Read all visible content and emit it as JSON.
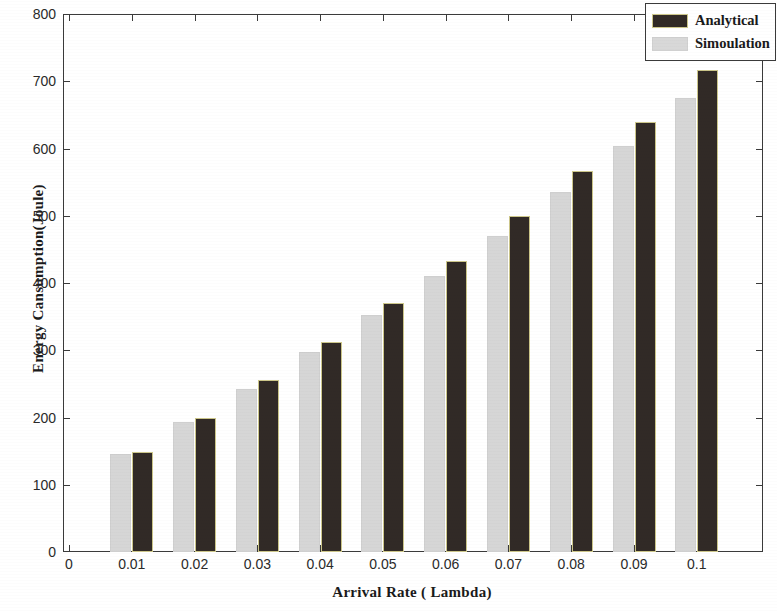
{
  "chart_data": {
    "type": "bar",
    "title": "Energy Cansumption In All Sensor Nodes",
    "xlabel": "Arrival Rate ( Lambda)",
    "ylabel": "Energy Cansumption(Joule)",
    "categories": [
      "0.01",
      "0.02",
      "0.03",
      "0.04",
      "0.05",
      "0.06",
      "0.07",
      "0.08",
      "0.09",
      "0.1"
    ],
    "xtick_labels": [
      "0",
      "0.01",
      "0.02",
      "0.03",
      "0.04",
      "0.05",
      "0.06",
      "0.07",
      "0.08",
      "0.09",
      "0.1"
    ],
    "ytick_labels": [
      "0",
      "100",
      "200",
      "300",
      "400",
      "500",
      "600",
      "700",
      "800"
    ],
    "ylim": [
      0,
      800
    ],
    "xlim": [
      0,
      0.105
    ],
    "grid": false,
    "legend_position": "top-right",
    "series": [
      {
        "name": "Simoulation",
        "color": "#d6d6d6",
        "values": [
          145,
          194,
          242,
          297,
          352,
          410,
          470,
          535,
          603,
          675
        ]
      },
      {
        "name": "Analytical",
        "color": "#312a26",
        "values": [
          149,
          200,
          256,
          313,
          371,
          432,
          499,
          567,
          639,
          717
        ]
      }
    ]
  },
  "legend": {
    "entries": [
      {
        "label": "Analytical",
        "swatch": "dark-swatch"
      },
      {
        "label": "Simoulation",
        "swatch": "light-swatch"
      }
    ]
  }
}
